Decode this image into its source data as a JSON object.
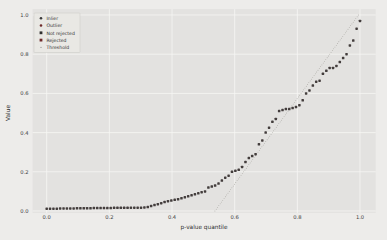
{
  "chart_data": {
    "type": "scatter",
    "title": "",
    "xlabel": "p-value quantile",
    "ylabel": "Value",
    "xlim": [
      -0.045,
      1.05
    ],
    "ylim": [
      -0.01,
      1.03
    ],
    "grid": true,
    "xticks": [
      {
        "v": 0.0,
        "label": "0.0"
      },
      {
        "v": 0.2,
        "label": "0.2"
      },
      {
        "v": 0.4,
        "label": "0.4"
      },
      {
        "v": 0.6,
        "label": "0.6"
      },
      {
        "v": 0.8,
        "label": "0.8"
      },
      {
        "v": 1.0,
        "label": "1.0"
      }
    ],
    "yticks": [
      {
        "v": 0.0,
        "label": "0.0"
      },
      {
        "v": 0.2,
        "label": "0.2"
      },
      {
        "v": 0.4,
        "label": "0.4"
      },
      {
        "v": 0.6,
        "label": "0.6"
      },
      {
        "v": 0.8,
        "label": "0.8"
      },
      {
        "v": 1.0,
        "label": "1.0"
      }
    ],
    "legend": {
      "position": "upper-left",
      "entries": [
        {
          "label": "Inlier",
          "marker": "circle",
          "color": "#3a3a3a"
        },
        {
          "label": "Outlier",
          "marker": "circle",
          "color": "#6e2a2a"
        },
        {
          "label": "Not rejected",
          "marker": "square",
          "color": "#2f2f2f"
        },
        {
          "label": "Rejected",
          "marker": "square",
          "color": "#6e2a2a"
        },
        {
          "label": "Threshold",
          "marker": "dot",
          "color": "#9a9a9a"
        }
      ]
    },
    "series": [
      {
        "name": "sorted p-values",
        "marker": "square",
        "color": "#433d3c",
        "x": [
          0.0,
          0.0108,
          0.0215,
          0.0323,
          0.043,
          0.0538,
          0.0645,
          0.0753,
          0.086,
          0.0968,
          0.1075,
          0.1183,
          0.129,
          0.1398,
          0.1505,
          0.1613,
          0.172,
          0.1828,
          0.1935,
          0.2043,
          0.2151,
          0.2258,
          0.2366,
          0.2473,
          0.2581,
          0.2688,
          0.2796,
          0.2903,
          0.3011,
          0.3118,
          0.3226,
          0.3333,
          0.3441,
          0.3548,
          0.3656,
          0.3763,
          0.3871,
          0.3978,
          0.4086,
          0.4194,
          0.4301,
          0.4409,
          0.4516,
          0.4624,
          0.4731,
          0.4839,
          0.4946,
          0.5054,
          0.5161,
          0.5269,
          0.5376,
          0.5484,
          0.5591,
          0.5699,
          0.5806,
          0.5914,
          0.6022,
          0.6129,
          0.6237,
          0.6344,
          0.6452,
          0.6559,
          0.6667,
          0.6774,
          0.6882,
          0.6989,
          0.7097,
          0.7204,
          0.7312,
          0.7419,
          0.7527,
          0.7634,
          0.7742,
          0.7849,
          0.7957,
          0.8065,
          0.8172,
          0.828,
          0.8387,
          0.8495,
          0.8602,
          0.871,
          0.8817,
          0.8925,
          0.9032,
          0.914,
          0.9247,
          0.9355,
          0.9462,
          0.957,
          0.9677,
          0.9785,
          0.9892,
          1.0
        ],
        "y": [
          0.012,
          0.012,
          0.012,
          0.012,
          0.013,
          0.013,
          0.013,
          0.013,
          0.013,
          0.014,
          0.014,
          0.014,
          0.014,
          0.014,
          0.015,
          0.015,
          0.015,
          0.015,
          0.015,
          0.015,
          0.016,
          0.016,
          0.016,
          0.016,
          0.016,
          0.017,
          0.017,
          0.017,
          0.017,
          0.018,
          0.02,
          0.025,
          0.03,
          0.035,
          0.04,
          0.046,
          0.05,
          0.053,
          0.057,
          0.06,
          0.065,
          0.07,
          0.075,
          0.08,
          0.085,
          0.09,
          0.096,
          0.1,
          0.12,
          0.125,
          0.13,
          0.14,
          0.155,
          0.17,
          0.18,
          0.2,
          0.205,
          0.21,
          0.225,
          0.25,
          0.27,
          0.28,
          0.29,
          0.34,
          0.36,
          0.4,
          0.425,
          0.455,
          0.47,
          0.51,
          0.515,
          0.52,
          0.52,
          0.525,
          0.53,
          0.54,
          0.565,
          0.6,
          0.615,
          0.64,
          0.66,
          0.665,
          0.7,
          0.715,
          0.73,
          0.73,
          0.74,
          0.76,
          0.78,
          0.8,
          0.845,
          0.87,
          0.93,
          0.97
        ]
      }
    ],
    "threshold_line": {
      "name": "Threshold",
      "style": "dotted",
      "color": "#8f8d86",
      "from": [
        0.537,
        0.0
      ],
      "to": [
        0.995,
        1.0
      ]
    },
    "colors": {
      "figure_background": "#edecea",
      "plot_background": "#e3e2e0",
      "grid": "#f6f6f4"
    }
  }
}
